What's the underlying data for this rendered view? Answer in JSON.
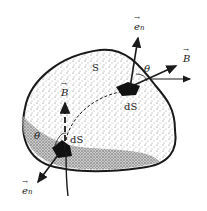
{
  "diagram": {
    "surface_label": "S",
    "top_patch": {
      "area_label": "dS",
      "normal_label": "e",
      "normal_sub": "n",
      "field_label": "B",
      "angle_label": "θ"
    },
    "bottom_patch": {
      "area_label": "dS",
      "normal_label": "e",
      "normal_sub": "n",
      "field_label": "B",
      "angle_label": "θ"
    },
    "colors": {
      "ink": "#1a1a1a",
      "fill_speckle": "#8a8a8a",
      "background": "#ffffff"
    }
  }
}
